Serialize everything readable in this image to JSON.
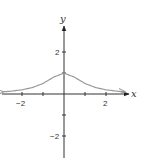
{
  "chart_data": {
    "type": "line",
    "title": "",
    "xlabel": "x",
    "ylabel": "y",
    "xlim": [
      -3,
      3
    ],
    "ylim": [
      -3,
      3.5
    ],
    "grid": false,
    "legend": null,
    "x_ticks": [
      -2,
      -1,
      1,
      2
    ],
    "x_tick_labels": [
      "-2",
      "2"
    ],
    "y_ticks": [
      -2,
      -1,
      1,
      2
    ],
    "y_tick_labels": [
      "-2",
      "2"
    ],
    "series": [
      {
        "name": "f(x)",
        "description": "bell-shaped curve peaking at (0, 1), approaching 0 as |x| grows; arrows at both ends",
        "x": [
          -2.9,
          -2.5,
          -2,
          -1.5,
          -1,
          -0.5,
          0,
          0.5,
          1,
          1.5,
          2,
          2.5,
          2.9
        ],
        "y": [
          0.106,
          0.138,
          0.2,
          0.308,
          0.5,
          0.8,
          1,
          0.8,
          0.5,
          0.308,
          0.2,
          0.138,
          0.106
        ]
      }
    ]
  },
  "labels": {
    "x_axis": "x",
    "y_axis": "y",
    "x_neg2": "−2",
    "x_pos2": "2",
    "y_pos2": "2",
    "y_neg2": "−2"
  }
}
